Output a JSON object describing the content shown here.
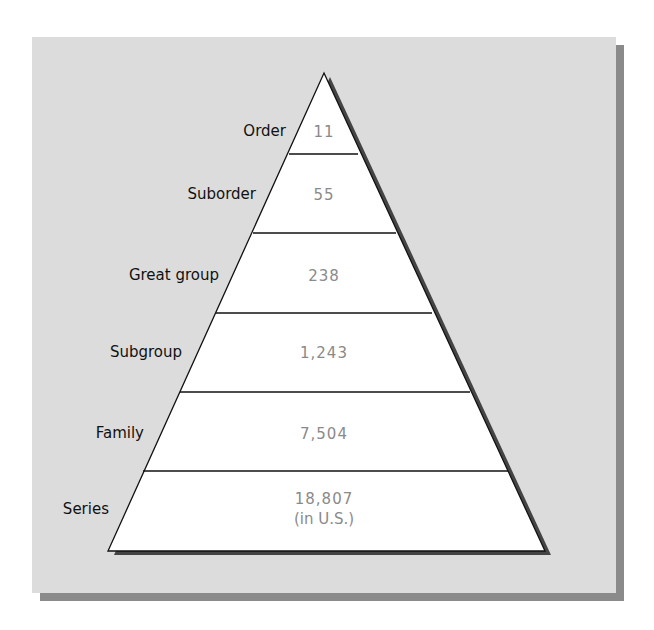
{
  "diagram": {
    "type": "pyramid",
    "title": "",
    "levels": [
      {
        "label": "Order",
        "count": "11"
      },
      {
        "label": "Suborder",
        "count": "55"
      },
      {
        "label": "Great group",
        "count": "238"
      },
      {
        "label": "Subgroup",
        "count": "1,243"
      },
      {
        "label": "Family",
        "count": "7,504"
      },
      {
        "label": "Series",
        "count": "18,807",
        "note": "(in U.S.)"
      }
    ],
    "colors": {
      "panel": "#dcdcdc",
      "shadow": "#8a8a8a",
      "tier_fill": "#ffffff",
      "value_text": "#8a8a8a",
      "label_text": "#111111"
    }
  }
}
